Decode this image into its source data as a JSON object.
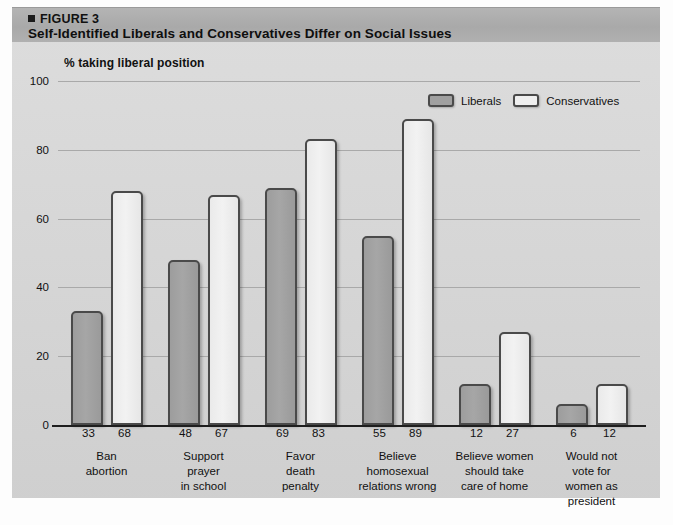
{
  "header": {
    "figure_marker": "figure-square-bullet",
    "figure_label": "FIGURE 3",
    "title": "Self-Identified Liberals and Conservatives Differ on Social Issues"
  },
  "legend": {
    "items": [
      {
        "label": "Liberals",
        "color": "#a0a0a0"
      },
      {
        "label": "Conservatives",
        "color": "#efefef"
      }
    ]
  },
  "source_note": "",
  "chart_data": {
    "type": "bar",
    "title": "Self-Identified Liberals and Conservatives Differ on Social Issues",
    "subtitle": "",
    "ylabel": "% taking liberal position",
    "xlabel": "",
    "ylim": [
      0,
      100
    ],
    "yticks": [
      0,
      20,
      40,
      60,
      80,
      100
    ],
    "ytick_labels": [
      "0",
      "20",
      "40",
      "60",
      "80",
      "100"
    ],
    "grid": true,
    "legend_position": "top-right",
    "categories": [
      "Ban\nabortion",
      "Support\nprayer\nin school",
      "Favor\ndeath\npenalty",
      "Believe\nhomosexual\nrelations wrong",
      "Believe women\nshould take\ncare of home",
      "Would not\nvote for\nwomen as\npresident"
    ],
    "series": [
      {
        "name": "Liberals",
        "color": "#a0a0a0",
        "values": [
          33,
          48,
          69,
          55,
          12,
          6
        ]
      },
      {
        "name": "Conservatives",
        "color": "#efefef",
        "values": [
          68,
          67,
          83,
          89,
          27,
          12
        ]
      }
    ]
  }
}
